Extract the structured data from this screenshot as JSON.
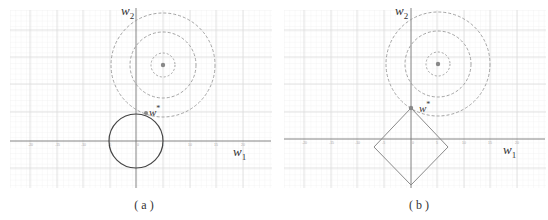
{
  "figure": {
    "panels": [
      {
        "id": "a",
        "caption": "( a )",
        "x_axis_label": "w",
        "x_axis_sub": "1",
        "y_axis_label": "w",
        "y_axis_sub": "2",
        "optimum_label": "w",
        "optimum_sup": "*",
        "constraint_shape": "circle",
        "description": "L2 regularization: elliptical loss contours touch circular constraint region"
      },
      {
        "id": "b",
        "caption": "( b )",
        "x_axis_label": "w",
        "x_axis_sub": "1",
        "y_axis_label": "w",
        "y_axis_sub": "2",
        "optimum_label": "w",
        "optimum_sup": "*",
        "constraint_shape": "diamond",
        "description": "L1 regularization: loss contours touch diamond constraint region at a vertex on the w2 axis"
      }
    ],
    "x_tick_labels": [
      "-20",
      "-15",
      "-10",
      "-5",
      "0",
      "5",
      "10",
      "15",
      "20"
    ],
    "colors": {
      "grid": "#e6e6e6",
      "axis": "#777777",
      "contour": "#9a9a9a",
      "constraint_a": "#444444",
      "constraint_b": "#8a8a8a",
      "point": "#888888"
    }
  }
}
